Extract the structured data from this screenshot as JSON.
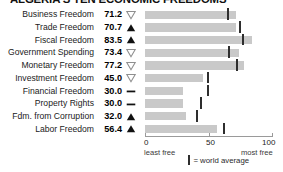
{
  "chart_data": {
    "type": "bar",
    "title": "ALGERIA'S TEN ECONOMIC FREEDOMS",
    "orientation": "horizontal",
    "xlabel": "",
    "ylabel": "",
    "xlim": [
      0,
      100
    ],
    "grid": false,
    "axis": {
      "ticks": [
        {
          "value": 0,
          "label": "0"
        },
        {
          "value": 50,
          "label": "50"
        },
        {
          "value": 100,
          "label": "100"
        }
      ],
      "left_end_label": "least free",
      "right_end_label": "most free"
    },
    "legend": {
      "position": "bottom",
      "marker": "vertical-tick",
      "text": "= world average"
    },
    "categories": [
      "Business Freedom",
      "Trade Freedom",
      "Fiscal Freedom",
      "Government Spending",
      "Monetary Freedom",
      "Investment Freedom",
      "Financial Freedom",
      "Property Rights",
      "Fdm. from Corruption",
      "Labor Freedom"
    ],
    "values": [
      71.2,
      70.7,
      83.5,
      73.4,
      77.2,
      45.0,
      30.0,
      30.0,
      32.0,
      56.4
    ],
    "value_labels": [
      "71.2",
      "70.7",
      "83.5",
      "73.4",
      "77.2",
      "45.0",
      "30.0",
      "30.0",
      "32.0",
      "56.4"
    ],
    "trends": [
      "down",
      "up",
      "up",
      "down",
      "down",
      "down",
      "flat",
      "flat",
      "up",
      "up"
    ],
    "world_average": [
      65.0,
      74.0,
      76.6,
      65.3,
      71.8,
      49.0,
      49.0,
      44.0,
      40.5,
      62.0
    ],
    "colors": {
      "bar": "#c9c9c9",
      "world_average_tick": "#2e2e2e",
      "text": "#1b1b1b",
      "axis": "#9a9a9a"
    }
  },
  "rows": [
    {
      "label": "Business Freedom",
      "value": "71.2",
      "trend": "down"
    },
    {
      "label": "Trade Freedom",
      "value": "70.7",
      "trend": "up"
    },
    {
      "label": "Fiscal Freedom",
      "value": "83.5",
      "trend": "up"
    },
    {
      "label": "Government Spending",
      "value": "73.4",
      "trend": "down"
    },
    {
      "label": "Monetary Freedom",
      "value": "77.2",
      "trend": "down"
    },
    {
      "label": "Investment Freedom",
      "value": "45.0",
      "trend": "down"
    },
    {
      "label": "Financial Freedom",
      "value": "30.0",
      "trend": "flat"
    },
    {
      "label": "Property Rights",
      "value": "30.0",
      "trend": "flat"
    },
    {
      "label": "Fdm. from Corruption",
      "value": "32.0",
      "trend": "up"
    },
    {
      "label": "Labor Freedom",
      "value": "56.4",
      "trend": "up"
    }
  ],
  "axis_labels": {
    "tick_0": "0",
    "tick_50": "50",
    "tick_100": "100",
    "least_free": "least free",
    "most_free": "most free"
  },
  "legend": {
    "text": "= world average"
  }
}
